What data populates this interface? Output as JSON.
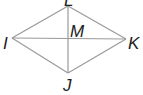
{
  "diagram": {
    "type": "rhombus-with-diagonals",
    "vertices": [
      {
        "id": "L",
        "label": "L",
        "x": 68,
        "y": 6,
        "lx": 64,
        "ly": 6
      },
      {
        "id": "I",
        "label": "I",
        "x": 12,
        "y": 38,
        "lx": 2,
        "ly": 49
      },
      {
        "id": "K",
        "label": "K",
        "x": 126,
        "y": 39,
        "lx": 128,
        "ly": 49
      },
      {
        "id": "J",
        "label": "J",
        "x": 68,
        "y": 73,
        "lx": 64,
        "ly": 91
      }
    ],
    "center": {
      "id": "M",
      "label": "M",
      "x": 68,
      "y": 38,
      "lx": 70,
      "ly": 37
    },
    "edges": [
      [
        "L",
        "K"
      ],
      [
        "K",
        "J"
      ],
      [
        "J",
        "I"
      ],
      [
        "I",
        "L"
      ]
    ],
    "diagonals": [
      [
        "I",
        "K"
      ],
      [
        "L",
        "J"
      ]
    ],
    "line_color": "#9a9a9a",
    "label_color": "#222222"
  }
}
